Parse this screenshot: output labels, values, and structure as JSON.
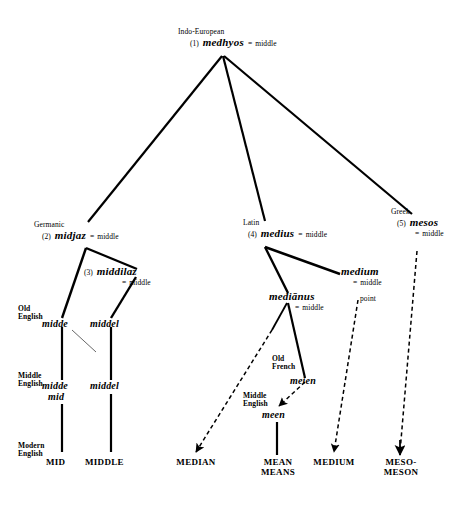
{
  "diagram": {
    "title_root": {
      "language": "Indo-European",
      "number": "(1)",
      "form": "medhyos",
      "eq": "=",
      "gloss": "middle"
    },
    "branches": {
      "germanic": {
        "language": "Germanic",
        "number": "(2)",
        "form": "midjaz",
        "eq": "=",
        "gloss": "middle"
      },
      "middilaz": {
        "number": "(3)",
        "form": "middilaz",
        "eq": "=",
        "gloss": "middle"
      },
      "latin": {
        "language": "Latin",
        "number": "(4)",
        "form": "medius",
        "eq": "=",
        "gloss": "middle"
      },
      "greek": {
        "language": "Greek",
        "number": "(5)",
        "form": "mesos",
        "eq": "=",
        "gloss": "middle"
      },
      "medianus": {
        "form": "mediānus",
        "eq": "=",
        "gloss": "middle"
      },
      "medium": {
        "form": "medium",
        "eq": "=",
        "gloss_line1": "middle",
        "gloss_line2": "point"
      }
    },
    "eras": {
      "old_english": {
        "line1": "Old",
        "line2": "English"
      },
      "middle_english": {
        "line1": "Middle",
        "line2": "English"
      },
      "modern_english": {
        "line1": "Modern",
        "line2": "English"
      },
      "old_french": {
        "line1": "Old",
        "line2": "French"
      },
      "middle_english_meen": {
        "line1": "Middle",
        "line2": "English"
      }
    },
    "english_column_mid": {
      "old_english": "midde",
      "middle_english_line1": "midde",
      "middle_english_line2": "mid",
      "modern_english": "MID"
    },
    "english_column_middle": {
      "old_english": "middel",
      "middle_english": "middel",
      "modern_english": "MIDDLE"
    },
    "french_line": {
      "old_french": "meien",
      "middle_english": "meen"
    },
    "terminals": [
      {
        "name": "median",
        "line1": "MEDIAN",
        "line2": ""
      },
      {
        "name": "mean",
        "line1": "MEAN",
        "line2": "MEANS"
      },
      {
        "name": "medium",
        "line1": "MEDIUM",
        "line2": ""
      },
      {
        "name": "meso",
        "line1": "MESO-",
        "line2": "MESON"
      }
    ],
    "colors": {
      "ink": "#000000",
      "background": "#ffffff"
    }
  }
}
